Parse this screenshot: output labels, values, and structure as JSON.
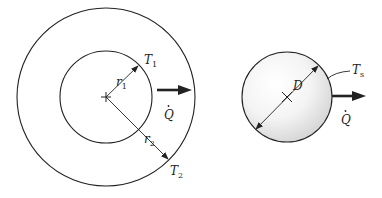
{
  "figure": {
    "left_diagram": {
      "description": "Cylindrical/spherical shell with inner radius r1 and outer radius r2",
      "labels": {
        "inner_temp": "T",
        "inner_temp_sub": "1",
        "outer_temp": "T",
        "outer_temp_sub": "2",
        "inner_radius": "r",
        "inner_radius_sub": "1",
        "outer_radius": "r",
        "outer_radius_sub": "2",
        "heat_rate": "Q"
      }
    },
    "right_diagram": {
      "description": "Solid sphere with diameter D and surface temperature Ts",
      "labels": {
        "surface_temp": "T",
        "surface_temp_sub": "s",
        "diameter": "D",
        "heat_rate": "Q"
      }
    },
    "colors": {
      "stroke": "#222222",
      "background": "#ffffff",
      "sphere_shade": "#d8d8d8"
    }
  }
}
